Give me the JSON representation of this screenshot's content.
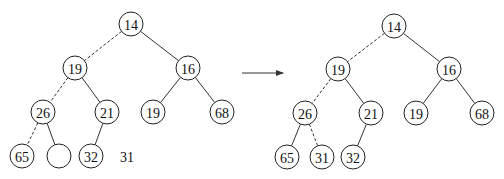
{
  "diagram": {
    "type": "binary-heap-insertion",
    "colors": {
      "stroke": "#222222",
      "fill": "#ffffff",
      "text": "#111111"
    },
    "before": {
      "nodes": [
        {
          "id": "b14",
          "label": "14",
          "x": 131,
          "y": 24
        },
        {
          "id": "b19",
          "label": "19",
          "x": 75,
          "y": 68
        },
        {
          "id": "b16",
          "label": "16",
          "x": 188,
          "y": 68
        },
        {
          "id": "b26",
          "label": "26",
          "x": 43,
          "y": 112
        },
        {
          "id": "b21",
          "label": "21",
          "x": 107,
          "y": 112
        },
        {
          "id": "b19r",
          "label": "19",
          "x": 153,
          "y": 112
        },
        {
          "id": "b68",
          "label": "68",
          "x": 222,
          "y": 112
        },
        {
          "id": "b65",
          "label": "65",
          "x": 22,
          "y": 156
        },
        {
          "id": "bhole",
          "label": "",
          "x": 59,
          "y": 156
        },
        {
          "id": "b32",
          "label": "32",
          "x": 91,
          "y": 156
        }
      ],
      "edges": [
        {
          "from": "b14",
          "to": "b19",
          "style": "dashed"
        },
        {
          "from": "b14",
          "to": "b16",
          "style": "solid"
        },
        {
          "from": "b19",
          "to": "b26",
          "style": "dashed"
        },
        {
          "from": "b19",
          "to": "b21",
          "style": "solid"
        },
        {
          "from": "b16",
          "to": "b19r",
          "style": "solid"
        },
        {
          "from": "b16",
          "to": "b68",
          "style": "solid"
        },
        {
          "from": "b26",
          "to": "b65",
          "style": "dashed"
        },
        {
          "from": "b26",
          "to": "bhole",
          "style": "solid"
        },
        {
          "from": "b21",
          "to": "b32",
          "style": "solid"
        }
      ],
      "pending_value": {
        "label": "31",
        "x": 127,
        "y": 156
      }
    },
    "arrow": {
      "x1": 242,
      "y1": 73,
      "x2": 283,
      "y2": 73
    },
    "after": {
      "nodes": [
        {
          "id": "a14",
          "label": "14",
          "x": 394,
          "y": 26
        },
        {
          "id": "a19",
          "label": "19",
          "x": 338,
          "y": 69
        },
        {
          "id": "a16",
          "label": "16",
          "x": 449,
          "y": 69
        },
        {
          "id": "a26",
          "label": "26",
          "x": 305,
          "y": 113
        },
        {
          "id": "a21",
          "label": "21",
          "x": 371,
          "y": 113
        },
        {
          "id": "a19r",
          "label": "19",
          "x": 416,
          "y": 113
        },
        {
          "id": "a68",
          "label": "68",
          "x": 482,
          "y": 113
        },
        {
          "id": "a65",
          "label": "65",
          "x": 287,
          "y": 157
        },
        {
          "id": "a31",
          "label": "31",
          "x": 322,
          "y": 157
        },
        {
          "id": "a32",
          "label": "32",
          "x": 353,
          "y": 157
        }
      ],
      "edges": [
        {
          "from": "a14",
          "to": "a19",
          "style": "dashed"
        },
        {
          "from": "a14",
          "to": "a16",
          "style": "solid"
        },
        {
          "from": "a19",
          "to": "a26",
          "style": "dashed"
        },
        {
          "from": "a19",
          "to": "a21",
          "style": "solid"
        },
        {
          "from": "a16",
          "to": "a19r",
          "style": "solid"
        },
        {
          "from": "a16",
          "to": "a68",
          "style": "solid"
        },
        {
          "from": "a26",
          "to": "a65",
          "style": "solid"
        },
        {
          "from": "a26",
          "to": "a31",
          "style": "dashed"
        },
        {
          "from": "a21",
          "to": "a32",
          "style": "solid"
        }
      ]
    },
    "node_radius": 12
  }
}
